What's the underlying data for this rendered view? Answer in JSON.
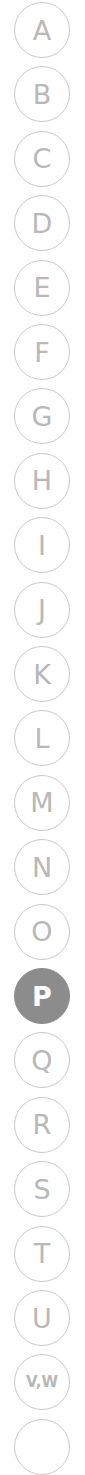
{
  "index": {
    "active": "P",
    "items": [
      {
        "label": "A"
      },
      {
        "label": "B"
      },
      {
        "label": "C"
      },
      {
        "label": "D"
      },
      {
        "label": "E"
      },
      {
        "label": "F"
      },
      {
        "label": "G"
      },
      {
        "label": "H"
      },
      {
        "label": "I"
      },
      {
        "label": "J"
      },
      {
        "label": "K"
      },
      {
        "label": "L"
      },
      {
        "label": "M"
      },
      {
        "label": "N"
      },
      {
        "label": "O"
      },
      {
        "label": "P"
      },
      {
        "label": "Q"
      },
      {
        "label": "R"
      },
      {
        "label": "S"
      },
      {
        "label": "T"
      },
      {
        "label": "U"
      },
      {
        "label": "V,W"
      },
      {
        "label": ""
      }
    ]
  },
  "colors": {
    "outline": "#c9c9c9",
    "letter": "#b8b8b8",
    "active_fill": "#8c8c8c",
    "active_letter": "#ffffff"
  }
}
